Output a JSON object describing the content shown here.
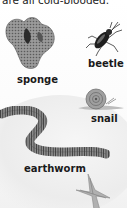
{
  "caption": "are all cold-blooded.",
  "animals": [
    {
      "name": "sponge",
      "icon": "sponge-icon"
    },
    {
      "name": "beetle",
      "icon": "beetle-icon"
    },
    {
      "name": "snail",
      "icon": "snail-icon"
    },
    {
      "name": "earthworm",
      "icon": "earthworm-icon"
    },
    {
      "name": "starfish",
      "icon": "starfish-icon"
    }
  ],
  "labels": {
    "sponge": "sponge",
    "beetle": "beetle",
    "snail": "snail",
    "earthworm": "earthworm"
  },
  "colors": {
    "text": "#1a1a1a",
    "sponge": "#8a8a8a",
    "beetle": "#2a2a2a",
    "snail": "#9a9a9a",
    "earthworm": "#707070",
    "starfish": "#a8a8a8"
  }
}
